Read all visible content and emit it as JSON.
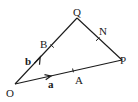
{
  "diagram": {
    "type": "vector-triangle",
    "stroke_color": "#1a1a1a",
    "background": "#ffffff",
    "points": {
      "O": {
        "label": "O",
        "x": 15,
        "y": 84
      },
      "Q": {
        "label": "Q",
        "x": 77,
        "y": 18
      },
      "P": {
        "label": "P",
        "x": 122,
        "y": 60
      },
      "B": {
        "label": "B",
        "x": 52,
        "y": 46
      },
      "N": {
        "label": "N",
        "x": 98,
        "y": 39
      },
      "A": {
        "label": "A",
        "x": 73,
        "y": 70
      }
    },
    "vectors": {
      "a": {
        "label": "a",
        "from": "O",
        "to": "P"
      },
      "b": {
        "label": "b",
        "from": "O",
        "to": "Q"
      }
    },
    "segments": [
      [
        "O",
        "Q"
      ],
      [
        "Q",
        "P"
      ],
      [
        "O",
        "P"
      ]
    ],
    "tick_marks": [
      "B",
      "N",
      "A"
    ]
  }
}
